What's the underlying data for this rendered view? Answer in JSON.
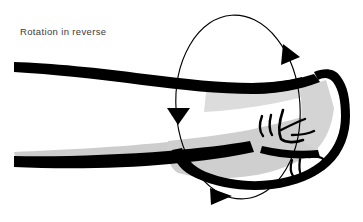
{
  "figure": {
    "title": "Rotation in reverse",
    "caption_text": "Rotation in reverse",
    "background_color": "#ffffff",
    "ink_color": "#000000",
    "shading_color": "#c9c9c9",
    "shading_color_light": "#dcdcdc",
    "caption_color": "#3a3a3a",
    "annotation": {
      "kind": "rotation-indicator",
      "shape": "ellipse",
      "direction": "reverse",
      "arrowhead_count": 3,
      "arrowheads": [
        {
          "name": "top-right-arrowhead",
          "direction": "right-down",
          "x": 292,
          "y": 54
        },
        {
          "name": "left-middle-arrowhead",
          "direction": "down",
          "x": 178,
          "y": 116
        },
        {
          "name": "bottom-arrowhead",
          "direction": "right",
          "x": 222,
          "y": 196
        }
      ],
      "ellipse": {
        "center_x": 238,
        "center_y": 107,
        "radius_x": 62,
        "radius_y": 92,
        "rotation_deg": -4,
        "stroke_width": 1.1
      }
    },
    "anatomy_parts": [
      "forearm",
      "wrist",
      "fist",
      "knuckles",
      "thumb"
    ]
  }
}
